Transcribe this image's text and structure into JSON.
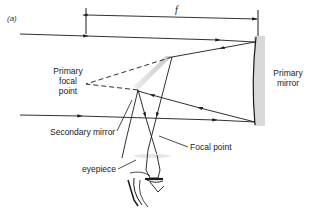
{
  "figure": {
    "panel_label": "(a)"
  },
  "dimension": {
    "label": "f"
  },
  "labels": {
    "primary_focal_point_line1": "Primary",
    "primary_focal_point_line2": "focal",
    "primary_focal_point_line3": "point",
    "primary_mirror_line1": "Primary",
    "primary_mirror_line2": "mirror",
    "secondary_mirror": "Secondary mirror",
    "focal_point": "Focal point",
    "eyepiece": "eyepiece"
  },
  "colors": {
    "line": "#1a1a1a",
    "mirror_fill": "#d9d9d9",
    "secondary_fill": "#cfcfcf",
    "background": "#ffffff"
  }
}
